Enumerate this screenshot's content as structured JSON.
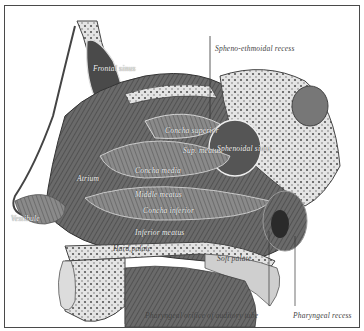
{
  "figure": {
    "labels": {
      "frontal_sinus": "Frontal sinus",
      "spheno_ethmoidal_recess": "Spheno-ethmoidal recess",
      "sphenoidal_sinus": "Sphenoidal sinus",
      "concha_superior": "Concha superior",
      "superior_meatus": "Sup. meatus",
      "concha_media": "Concha media",
      "middle_meatus": "Middle meatus",
      "concha_inferior": "Concha inferior",
      "inferior_meatus": "Inferior meatus",
      "atrium": "Atrium",
      "vestibule": "Vestibule",
      "hard_palate": "Hard palate",
      "soft_palate": "Soft palate",
      "pharyngeal_orifice": "Pharyngeal orifice of auditory tube",
      "pharyngeal_recess": "Pharyngeal recess"
    }
  },
  "colors": {
    "frame": "#4a4a4a",
    "tissue_dark": "#3a3a3a",
    "tissue_mid": "#7a7a7a",
    "bone_light": "#d8d8d8"
  }
}
